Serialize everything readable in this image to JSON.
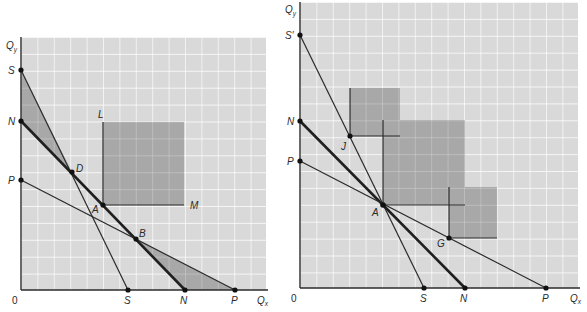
{
  "colors": {
    "grid_fill": "#d9d9d9",
    "grid_line": "#ffffff",
    "shade": "#a9a9a9",
    "shade_dark": "#9a9a9a",
    "line": "#2b2b2b"
  },
  "left_panel": {
    "y_axis_label": "Q",
    "y_axis_sub": "y",
    "x_axis_label": "Q",
    "x_axis_sub": "x",
    "origin_label": "0",
    "points": {
      "S_y": "S",
      "N_y": "N",
      "P_y": "P",
      "S_x": "S",
      "N_x": "N",
      "P_x": "P",
      "D": "D",
      "A": "A",
      "B": "B",
      "L": "L",
      "M": "M"
    }
  },
  "right_panel": {
    "y_axis_label": "Q",
    "y_axis_sub": "y",
    "x_axis_label": "Q",
    "x_axis_sub": "x",
    "origin_label": "0",
    "points": {
      "S_prime_y": "S′",
      "N_y": "N",
      "P_y": "P",
      "S_x": "S",
      "N_x": "N",
      "P_x": "P",
      "J": "J",
      "A": "A",
      "G": "G"
    }
  }
}
